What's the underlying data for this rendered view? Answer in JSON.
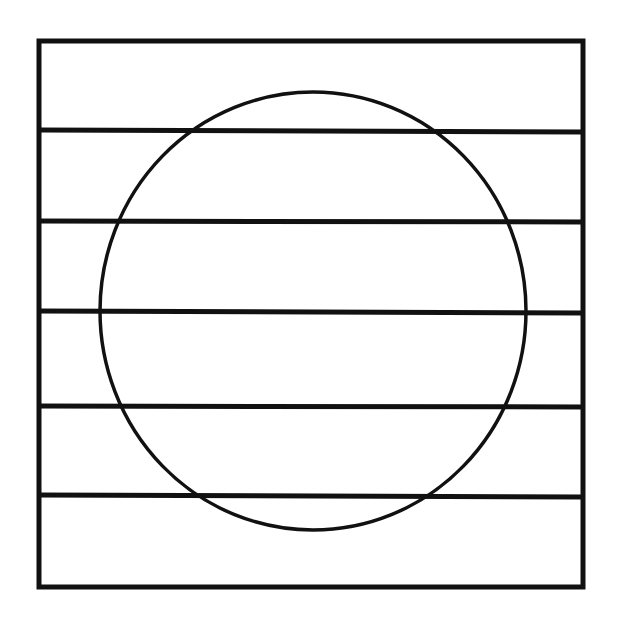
{
  "diagram": {
    "stroke_color": "#111111",
    "background": "#ffffff",
    "box": {
      "x": 39,
      "y": 41,
      "width": 544,
      "height": 546
    },
    "horizontal_lines_y": [
      130,
      221,
      311,
      406,
      495
    ],
    "circle": {
      "cx": 313,
      "cy": 311,
      "rx": 213,
      "ry": 219
    }
  }
}
